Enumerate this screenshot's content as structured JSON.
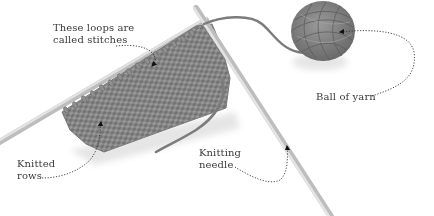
{
  "diagram": {
    "type": "annotated-illustration",
    "colors": {
      "background": "#ffffff",
      "yarn": "#8a8a8a",
      "yarn_dark": "#5e5e5e",
      "needle": "#cfcfcf",
      "needle_edge": "#a8a8a8",
      "leader_line": "#333333",
      "label_text": "#3a3a3a"
    },
    "labels": [
      {
        "id": "stitches",
        "lines": [
          "These loops are",
          "called stitches"
        ],
        "points_to": "stitches on top needle"
      },
      {
        "id": "ball",
        "lines": [
          "Ball of yarn"
        ],
        "points_to": "ball of yarn"
      },
      {
        "id": "needle",
        "lines": [
          "Knitting",
          "needle"
        ],
        "points_to": "right knitting needle"
      },
      {
        "id": "rows",
        "lines": [
          "Knitted",
          "rows"
        ],
        "points_to": "knitted fabric rows"
      }
    ]
  }
}
